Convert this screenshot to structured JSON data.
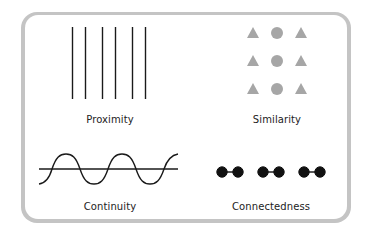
{
  "diagram": {
    "colors": {
      "frame": "#c4c4c4",
      "card": "#ffffff",
      "ink": "#1a1a1a",
      "shape_gray": "#a6a6a6"
    },
    "panels": [
      {
        "id": "proximity",
        "label": "Proximity",
        "description": "Six vertical lines grouped in three pairs"
      },
      {
        "id": "similarity",
        "label": "Similarity",
        "description": "3x3 grid: triangle, circle, triangle per row"
      },
      {
        "id": "continuity",
        "label": "Continuity",
        "description": "Sine wave crossing a horizontal line"
      },
      {
        "id": "connectedness",
        "label": "Connectedness",
        "description": "Six dots connected in three pairs"
      }
    ]
  }
}
